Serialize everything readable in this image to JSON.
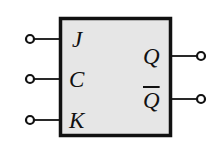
{
  "diagram": {
    "type": "JK flip-flop block symbol",
    "colors": {
      "stroke": "#111111",
      "box_fill": "#e6e6e6",
      "background": "#ffffff"
    },
    "box": {
      "x": 60,
      "y": 18,
      "width": 110,
      "height": 117
    },
    "inputs": [
      {
        "label": "J",
        "y": 39
      },
      {
        "label": "C",
        "y": 79
      },
      {
        "label": "K",
        "y": 120
      }
    ],
    "outputs": [
      {
        "label": "Q",
        "y": 56,
        "inverted": false
      },
      {
        "label": "Q",
        "y": 99,
        "inverted": true
      }
    ]
  }
}
